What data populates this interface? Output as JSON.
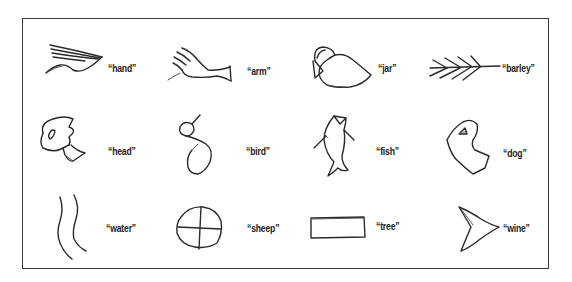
{
  "figure": {
    "border_color": "#3a3a3a",
    "stroke_color": "#2a2a2a",
    "rows": 3,
    "columns": 4,
    "pictographs": [
      {
        "id": "hand",
        "label": "“hand”",
        "icon": "hand-pictograph-icon",
        "row": 0,
        "col": 0
      },
      {
        "id": "arm",
        "label": "“arm”",
        "icon": "arm-pictograph-icon",
        "row": 0,
        "col": 1
      },
      {
        "id": "jar",
        "label": "“jar”",
        "icon": "jar-pictograph-icon",
        "row": 0,
        "col": 2
      },
      {
        "id": "barley",
        "label": "“barley”",
        "icon": "barley-pictograph-icon",
        "row": 0,
        "col": 3
      },
      {
        "id": "head",
        "label": "“head”",
        "icon": "head-pictograph-icon",
        "row": 1,
        "col": 0
      },
      {
        "id": "bird",
        "label": "“bird”",
        "icon": "bird-pictograph-icon",
        "row": 1,
        "col": 1
      },
      {
        "id": "fish",
        "label": "“fish”",
        "icon": "fish-pictograph-icon",
        "row": 1,
        "col": 2
      },
      {
        "id": "dog",
        "label": "“dog”",
        "icon": "dog-pictograph-icon",
        "row": 1,
        "col": 3
      },
      {
        "id": "water",
        "label": "“water”",
        "icon": "water-pictograph-icon",
        "row": 2,
        "col": 0
      },
      {
        "id": "sheep",
        "label": "“sheep”",
        "icon": "sheep-pictograph-icon",
        "row": 2,
        "col": 1
      },
      {
        "id": "tree",
        "label": "“tree”",
        "icon": "tree-pictograph-icon",
        "row": 2,
        "col": 2
      },
      {
        "id": "wine",
        "label": "“wine”",
        "icon": "wine-pictograph-icon",
        "row": 2,
        "col": 3
      }
    ]
  }
}
